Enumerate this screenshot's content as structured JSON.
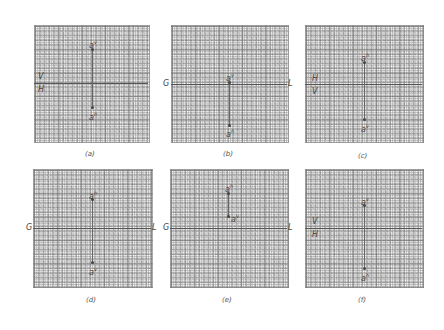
{
  "panels": [
    {
      "id": "a",
      "caption": "(a)",
      "axis_left": "V",
      "axis_left_below": "H",
      "axis_right": "",
      "point_top": {
        "base": "a",
        "sup": "v"
      },
      "point_bottom": {
        "base": "a",
        "sup": "h"
      }
    },
    {
      "id": "b",
      "caption": "(b)",
      "axis_left": "G",
      "axis_right": "L",
      "point_top": {
        "base": "a",
        "sup": "v"
      },
      "point_bottom": {
        "base": "a",
        "sup": "h"
      }
    },
    {
      "id": "c",
      "caption": "(c)",
      "axis_left": "H",
      "axis_left_below": "V",
      "axis_right": "",
      "point_top": {
        "base": "a",
        "sup": "h"
      },
      "point_bottom": {
        "base": "a",
        "sup": "v"
      }
    },
    {
      "id": "d",
      "caption": "(d)",
      "axis_left": "G",
      "axis_right": "L",
      "point_top": {
        "base": "a",
        "sup": "h"
      },
      "point_bottom": {
        "base": "a",
        "sup": "v"
      }
    },
    {
      "id": "e",
      "caption": "(e)",
      "axis_left": "G",
      "axis_right": "L",
      "point_top": {
        "base": "a",
        "sup": "h"
      },
      "point_bottom": {
        "base": "a",
        "sup": "v"
      }
    },
    {
      "id": "f",
      "caption": "(f)",
      "axis_left": "V",
      "axis_left_below": "H",
      "axis_right": "",
      "point_top": {
        "base": "a",
        "sup": "v"
      },
      "point_bottom": {
        "base": "a",
        "sup": "h"
      }
    }
  ]
}
